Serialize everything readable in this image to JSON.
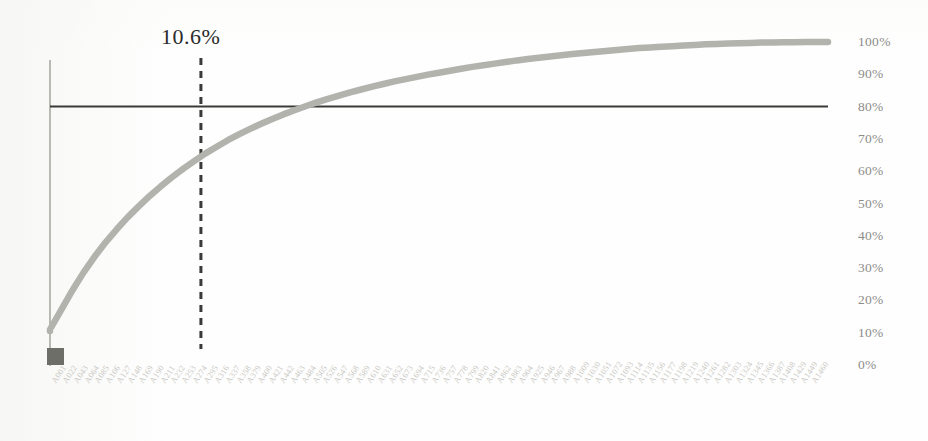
{
  "chart_data": {
    "type": "line",
    "title": "",
    "subtitle": "",
    "xlabel": "",
    "ylabel": "",
    "ylim": [
      0,
      100
    ],
    "grid": false,
    "legend": "none",
    "y_axis_position": "right",
    "y_ticks": [
      "100%",
      "90%",
      "80%",
      "70%",
      "60%",
      "50%",
      "40%",
      "30%",
      "20%",
      "10%",
      "0%"
    ],
    "y_tick_values": [
      100,
      90,
      80,
      70,
      60,
      50,
      40,
      30,
      20,
      10,
      0
    ],
    "categories": [
      "A001",
      "A022",
      "A043",
      "A064",
      "A085",
      "A106",
      "A127",
      "A148",
      "A169",
      "A190",
      "A211",
      "A232",
      "A253",
      "A274",
      "A295",
      "A316",
      "A337",
      "A358",
      "A379",
      "A400",
      "A421",
      "A442",
      "A463",
      "A484",
      "A505",
      "A526",
      "A547",
      "A568",
      "A589",
      "A610",
      "A631",
      "A652",
      "A673",
      "A694",
      "A715",
      "A736",
      "A757",
      "A778",
      "A799",
      "A820",
      "A841",
      "A862",
      "A883",
      "A904",
      "A925",
      "A946",
      "A967",
      "A988",
      "A1009",
      "A1030",
      "A1051",
      "A1072",
      "A1093",
      "A1114",
      "A1135",
      "A1156",
      "A1177",
      "A1198",
      "A1219",
      "A1240",
      "A1261",
      "A1282",
      "A1303",
      "A1324",
      "A1345",
      "A1366",
      "A1387",
      "A1408",
      "A1429",
      "A1449",
      "A1460"
    ],
    "series": [
      {
        "name": "Cumulative percentage",
        "color": "#b3b3ad",
        "values": [
          11.0,
          17.0,
          23.0,
          28.5,
          33.5,
          38.0,
          42.0,
          45.8,
          49.2,
          52.4,
          55.4,
          58.2,
          60.8,
          63.2,
          65.5,
          67.6,
          69.6,
          71.4,
          73.1,
          74.7,
          76.2,
          77.6,
          78.9,
          80.1,
          81.3,
          82.4,
          83.4,
          84.4,
          85.3,
          86.2,
          87.0,
          87.8,
          88.5,
          89.2,
          89.9,
          90.5,
          91.1,
          91.7,
          92.3,
          92.8,
          93.3,
          93.8,
          94.3,
          94.7,
          95.1,
          95.5,
          95.9,
          96.3,
          96.6,
          96.9,
          97.2,
          97.5,
          97.8,
          98.1,
          98.3,
          98.5,
          98.7,
          98.9,
          99.1,
          99.3,
          99.4,
          99.5,
          99.6,
          99.7,
          99.8,
          99.85,
          99.9,
          99.93,
          99.96,
          99.98,
          100.0
        ]
      }
    ],
    "reference_line": {
      "name": "80-percent-threshold",
      "orientation": "horizontal",
      "value": 80,
      "color": "#3a3a38",
      "style": "solid"
    },
    "callout_line": {
      "name": "pareto-cutoff",
      "orientation": "vertical",
      "label": "10.6%",
      "x_fraction": 0.106,
      "color": "#3a3a38",
      "style": "dashed"
    },
    "origin_marker": {
      "name": "origin-block",
      "color": "#6e6e68"
    },
    "axis_color": "#a9a9a3",
    "curve_color": "#b3b3ad",
    "background_color": "#fefefe"
  },
  "annotations": {
    "callout_text": "10.6%"
  }
}
